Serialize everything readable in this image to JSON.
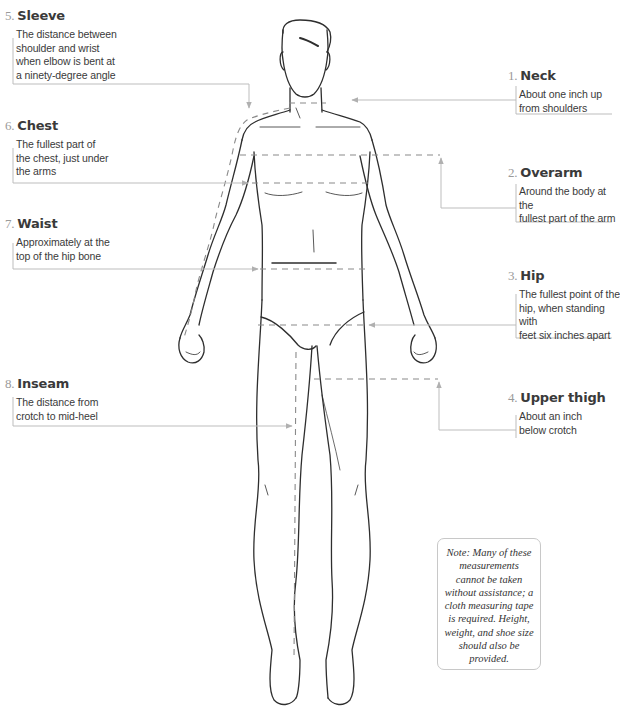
{
  "measurements": [
    {
      "num": "1.",
      "title": "Neck",
      "desc": "About one inch up\nfrom shoulders"
    },
    {
      "num": "2.",
      "title": "Overarm",
      "desc": "Around the body at the\nfullest part of the arm"
    },
    {
      "num": "3.",
      "title": "Hip",
      "desc": "The fullest point of the\nhip, when standing with\nfeet six inches apart"
    },
    {
      "num": "4.",
      "title": "Upper thigh",
      "desc": "About an inch\nbelow crotch"
    },
    {
      "num": "5.",
      "title": "Sleeve",
      "desc": "The distance between\nshoulder and wrist\nwhen elbow is bent at\na ninety-degree angle"
    },
    {
      "num": "6.",
      "title": "Chest",
      "desc": "The fullest part of\nthe chest, just under\nthe arms"
    },
    {
      "num": "7.",
      "title": "Waist",
      "desc": "Approximately at the\ntop of the hip bone"
    },
    {
      "num": "8.",
      "title": "Inseam",
      "desc": "The distance from\ncrotch to mid-heel"
    }
  ],
  "note": "Note: Many of these measurements cannot be taken without assistance; a cloth measuring tape is required. Height, weight, and shoe size should also be provided.",
  "colors": {
    "text": "#3a3a3a",
    "number": "#9a9a9a",
    "leader": "#b8b8b8",
    "dash": "#8a8a8a",
    "sketch": "#2e2e2e"
  }
}
